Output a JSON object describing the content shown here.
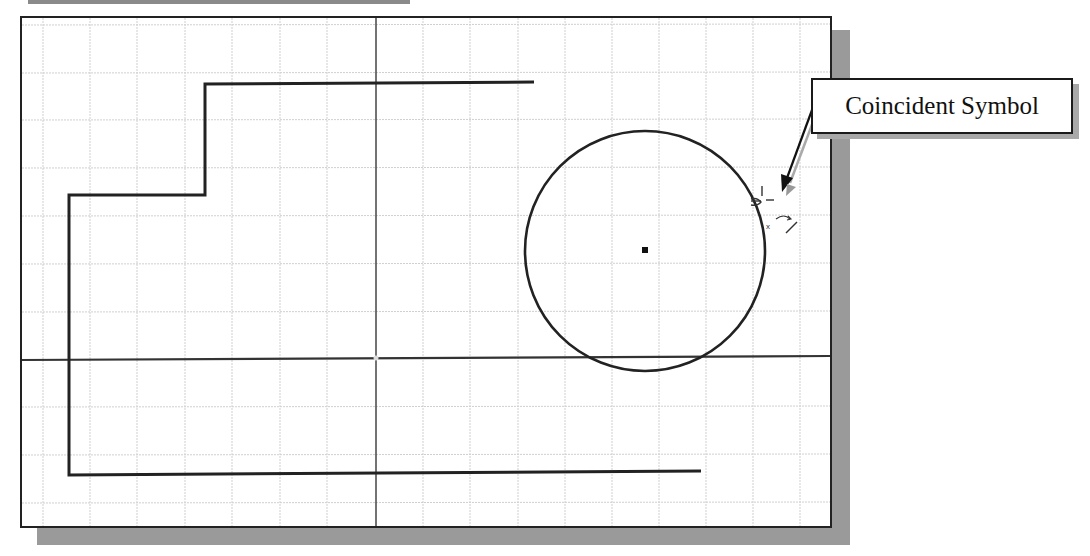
{
  "callout": {
    "label": "Coincident Symbol"
  },
  "colors": {
    "grid": "#cfcfcf",
    "geometry": "#222222",
    "axis": "#444444",
    "shadow": "#9a9a9a",
    "background": "#ffffff"
  },
  "sketch": {
    "circle": {
      "cx": 645,
      "cy": 250,
      "r": 120
    },
    "center_point": {
      "x": 645,
      "y": 250
    },
    "profile_polyline": "534,82 205,84 205,195 69,195 69,475 701,471",
    "vertical_axis_x": 376,
    "horizontal_axis": {
      "y_left": 360,
      "y_right": 356
    },
    "constraint_symbol": "coincident"
  }
}
